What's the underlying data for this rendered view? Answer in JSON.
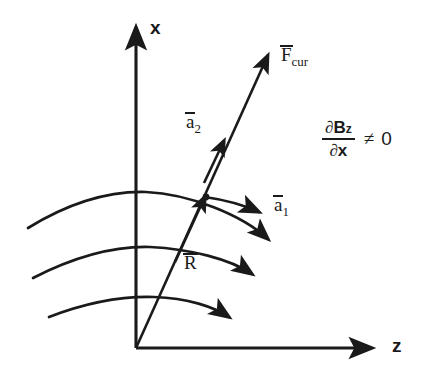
{
  "figure": {
    "type": "physics-vector-diagram",
    "background_color": "#ffffff",
    "ink_color": "#1a1a1a"
  },
  "axes": {
    "x_label": "x",
    "z_label": "z",
    "origin": {
      "x": 136,
      "y": 348
    },
    "x_axis_tip": {
      "x": 136,
      "y": 20
    },
    "z_axis_tip": {
      "x": 380,
      "y": 348
    }
  },
  "vectors": [
    {
      "id": "R",
      "label": "R",
      "overbar": true,
      "subscript": "",
      "from": {
        "x": 136,
        "y": 348
      },
      "to": {
        "x": 207,
        "y": 198
      },
      "label_pos": {
        "x": 184,
        "y": 253
      }
    },
    {
      "id": "a2",
      "label": "a",
      "overbar": true,
      "subscript": "2",
      "from": {
        "x": 207,
        "y": 198
      },
      "to": {
        "x": 226,
        "y": 144
      },
      "label_pos": {
        "x": 186,
        "y": 112
      }
    },
    {
      "id": "a1",
      "label": "a",
      "overbar": true,
      "subscript": "1",
      "from": {
        "x": 207,
        "y": 198
      },
      "to": {
        "x": 267,
        "y": 214
      },
      "label_pos": {
        "x": 274,
        "y": 195
      }
    },
    {
      "id": "F_cur",
      "label": "F",
      "overbar": true,
      "subscript": "cur",
      "from": {
        "x": 207,
        "y": 198
      },
      "to": {
        "x": 271,
        "y": 48
      },
      "label_pos": {
        "x": 281,
        "y": 45
      }
    }
  ],
  "field_lines": {
    "count": 3,
    "description": "magnetic field line arcs curving downward to the right with arrowheads",
    "arcs": [
      {
        "start": {
          "x": 28,
          "y": 228
        },
        "peak": {
          "x": 143,
          "y": 192
        },
        "end": {
          "x": 277,
          "y": 247
        },
        "arrowhead": true
      },
      {
        "start": {
          "x": 33,
          "y": 278
        },
        "peak": {
          "x": 146,
          "y": 246
        },
        "end": {
          "x": 260,
          "y": 281
        },
        "arrowhead": true
      },
      {
        "start": {
          "x": 49,
          "y": 317
        },
        "peak": {
          "x": 150,
          "y": 296
        },
        "end": {
          "x": 236,
          "y": 323
        },
        "arrowhead": true
      }
    ]
  },
  "annotation": {
    "numerator_symbol": "∂",
    "numerator_var": "B",
    "numerator_sub": "z",
    "denominator_symbol": "∂",
    "denominator_var": "x",
    "relation": "≠",
    "value": "0",
    "full_text": "∂B_z/∂x ≠ 0"
  },
  "labels": {
    "x_axis": "x",
    "z_axis": "z",
    "a_base": "a",
    "a1_sub": "1",
    "a2_sub": "2",
    "F_base": "F",
    "F_sub": "cur",
    "R_base": "R"
  }
}
